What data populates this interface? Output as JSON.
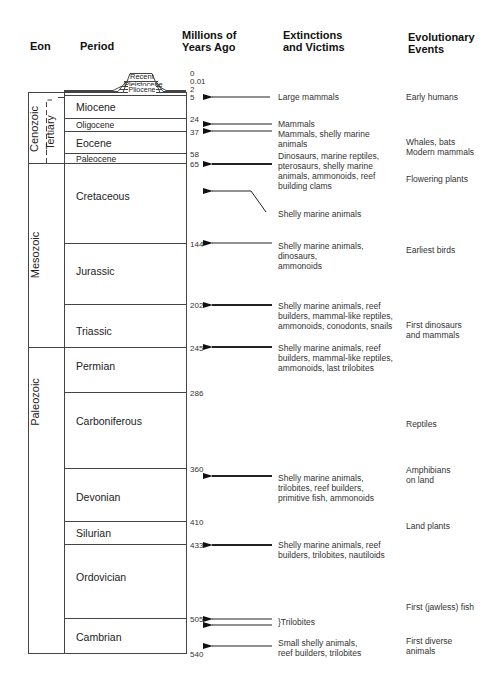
{
  "headers": {
    "eon": "Eon",
    "period": "Period",
    "mya": "Millions of\nYears Ago",
    "mya_line1": "Millions of",
    "mya_line2": "Years Ago",
    "extinctions_line1": "Extinctions",
    "extinctions_line2": "and Victims",
    "evolution_line1": "Evolutionary",
    "evolution_line2": "Events"
  },
  "epochs_quaternary": [
    {
      "label": "Recent"
    },
    {
      "label": "Pleistocene"
    },
    {
      "label": "Pliocene"
    }
  ],
  "eons": [
    {
      "label": "Cenozoic"
    },
    {
      "label": "Mesozoic"
    },
    {
      "label": "Paleozoic"
    }
  ],
  "sub_eon": {
    "label": "Tertiary"
  },
  "periods": [
    {
      "label": "Miocene"
    },
    {
      "label": "Oligocene"
    },
    {
      "label": "Eocene"
    },
    {
      "label": "Paleocene"
    },
    {
      "label": "Cretaceous"
    },
    {
      "label": "Jurassic"
    },
    {
      "label": "Triassic"
    },
    {
      "label": "Permian"
    },
    {
      "label": "Carboniferous"
    },
    {
      "label": "Devonian"
    },
    {
      "label": "Silurian"
    },
    {
      "label": "Ordovician"
    },
    {
      "label": "Cambrian"
    }
  ],
  "ticks": [
    "0",
    "0.01",
    "2",
    "5",
    "24",
    "37",
    "58",
    "65",
    "144",
    "202",
    "245",
    "286",
    "360",
    "410",
    "433",
    "505",
    "540"
  ],
  "extinctions": [
    {
      "text": "Large mammals"
    },
    {
      "text": "Mammals"
    },
    {
      "text": "Mammals, shelly marine\nanimals"
    },
    {
      "text": "Dinosaurs, marine reptiles,\npterosaurs, shelly marine\nanimals, ammonoids, reef\nbuilding clams"
    },
    {
      "text": "Shelly marine animals"
    },
    {
      "text": "Shelly marine animals,\ndinosaurs,\nammonoids"
    },
    {
      "text": "Shelly marine animals, reef\nbuilders, mammal-like reptiles,\nammonoids, conodonts, snails"
    },
    {
      "text": "Shelly marine animals, reef\nbuilders, mammal-like reptiles,\nammonoids, last trilobites"
    },
    {
      "text": "Shelly marine animals,\ntrilobites, reef builders,\nprimitive fish, ammonoids"
    },
    {
      "text": "Shelly marine animals, reef\nbuilders, trilobites, nautiloids"
    },
    {
      "text": "}Trilobites"
    },
    {
      "text": "Small shelly animals,\nreef builders, trilobites"
    }
  ],
  "evolutionary_events": [
    {
      "text": "Early humans"
    },
    {
      "text": "Whales, bats\nModern mammals"
    },
    {
      "text": "Flowering  plants"
    },
    {
      "text": "Earliest birds"
    },
    {
      "text": "First dinosaurs\nand mammals"
    },
    {
      "text": "Reptiles"
    },
    {
      "text": "Amphibians\non land"
    },
    {
      "text": "Land plants"
    },
    {
      "text": "First (jawless) fish"
    },
    {
      "text": "First diverse\nanimals"
    }
  ],
  "colors": {
    "line": "#444444",
    "text": "#222222",
    "background": "#ffffff"
  }
}
